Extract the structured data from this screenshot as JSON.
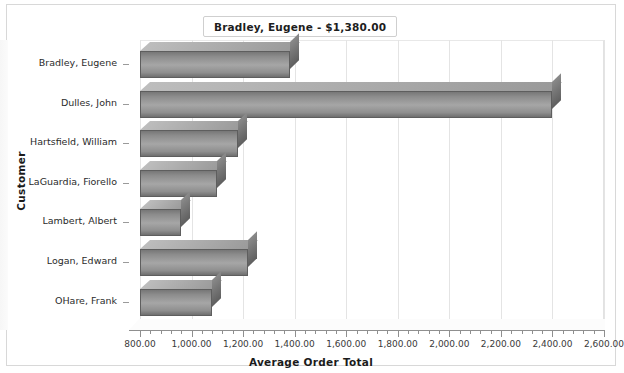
{
  "title": "Bradley, Eugene - $1,380.00",
  "axis": {
    "x_title": "Average Order Total",
    "y_title": "Customer"
  },
  "chart_data": {
    "type": "bar",
    "orientation": "horizontal",
    "title": "Bradley, Eugene - $1,380.00",
    "xlabel": "Average Order Total",
    "ylabel": "Customer",
    "xlim": [
      800,
      2600
    ],
    "xtick_step": 200,
    "grid": true,
    "legend": null,
    "categories": [
      "Bradley, Eugene",
      "Dulles, John",
      "Hartsfield, William",
      "LaGuardia, Fiorello",
      "Lambert, Albert",
      "Logan, Edward",
      "OHare, Frank"
    ],
    "values": [
      1380,
      2400,
      1180,
      1100,
      960,
      1220,
      1080
    ],
    "tick_labels": [
      "800.00",
      "1,000.00",
      "1,200.00",
      "1,400.00",
      "1,600.00",
      "1,800.00",
      "2,000.00",
      "2,200.00",
      "2,400.00",
      "2,600.00"
    ],
    "tick_values": [
      800,
      1000,
      1200,
      1400,
      1600,
      1800,
      2000,
      2200,
      2400,
      2600
    ],
    "bar_color": "#9a9a9a",
    "grid_color": "#e4e4e4"
  }
}
